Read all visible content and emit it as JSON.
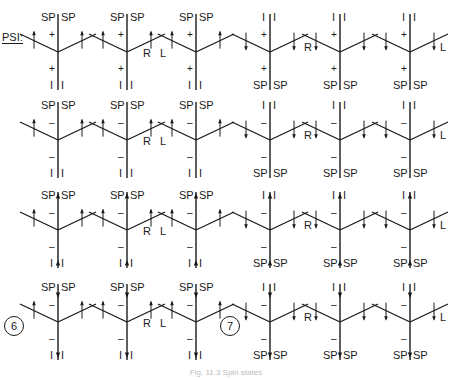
{
  "figure": {
    "psi_label": "PSI:",
    "caption": "Fig. 11.3 Spin states",
    "ink_color": "#1a1a1a",
    "rows": [
      {
        "sign": "+",
        "stem_arrow": "none",
        "cells": [
          {
            "top": [
              "SP",
              "SP"
            ],
            "bottom": [
              "I",
              "I"
            ],
            "arms": "up",
            "side": "",
            "circle": ""
          },
          {
            "top": [
              "SP",
              "SP"
            ],
            "bottom": [
              "I",
              "I"
            ],
            "arms": "up",
            "side": "R",
            "circle": ""
          },
          {
            "top": [
              "SP",
              "SP"
            ],
            "bottom": [
              "I",
              "I"
            ],
            "arms": "up",
            "side": "L",
            "circle": ""
          },
          {
            "top": [
              "I",
              "I"
            ],
            "bottom": [
              "SP",
              "SP"
            ],
            "arms": "down",
            "side": "",
            "circle": ""
          },
          {
            "top": [
              "I",
              "I"
            ],
            "bottom": [
              "SP",
              "SP"
            ],
            "arms": "down",
            "side": "R",
            "circle": ""
          },
          {
            "top": [
              "I",
              "I"
            ],
            "bottom": [
              "SP",
              "SP"
            ],
            "arms": "down",
            "side": "L",
            "circle": ""
          }
        ]
      },
      {
        "sign": "–",
        "stem_arrow": "none",
        "cells": [
          {
            "top": [
              "SP",
              "SP"
            ],
            "bottom": [
              "I",
              "I"
            ],
            "arms": "up",
            "side": "",
            "circle": ""
          },
          {
            "top": [
              "SP",
              "SP"
            ],
            "bottom": [
              "I",
              "I"
            ],
            "arms": "up",
            "side": "R",
            "circle": ""
          },
          {
            "top": [
              "SP",
              "SP"
            ],
            "bottom": [
              "I",
              "I"
            ],
            "arms": "up",
            "side": "L",
            "circle": ""
          },
          {
            "top": [
              "I",
              "I"
            ],
            "bottom": [
              "SP",
              "SP"
            ],
            "arms": "down",
            "side": "",
            "circle": ""
          },
          {
            "top": [
              "I",
              "I"
            ],
            "bottom": [
              "SP",
              "SP"
            ],
            "arms": "down",
            "side": "R",
            "circle": ""
          },
          {
            "top": [
              "I",
              "I"
            ],
            "bottom": [
              "SP",
              "SP"
            ],
            "arms": "down",
            "side": "L",
            "circle": ""
          }
        ]
      },
      {
        "sign": "–",
        "stem_arrow": "up",
        "cells": [
          {
            "top": [
              "SP",
              "SP"
            ],
            "bottom": [
              "I",
              "I"
            ],
            "arms": "up",
            "side": "",
            "circle": ""
          },
          {
            "top": [
              "SP",
              "SP"
            ],
            "bottom": [
              "I",
              "I"
            ],
            "arms": "up",
            "side": "R",
            "circle": ""
          },
          {
            "top": [
              "SP",
              "SP"
            ],
            "bottom": [
              "I",
              "I"
            ],
            "arms": "up",
            "side": "L",
            "circle": ""
          },
          {
            "top": [
              "I",
              "I"
            ],
            "bottom": [
              "SP",
              "SP"
            ],
            "arms": "down",
            "side": "",
            "circle": ""
          },
          {
            "top": [
              "I",
              "I"
            ],
            "bottom": [
              "SP",
              "SP"
            ],
            "arms": "down",
            "side": "R",
            "circle": ""
          },
          {
            "top": [
              "I",
              "I"
            ],
            "bottom": [
              "SP",
              "SP"
            ],
            "arms": "down",
            "side": "L",
            "circle": ""
          }
        ]
      },
      {
        "sign": "–",
        "stem_arrow": "down",
        "cells": [
          {
            "top": [
              "SP",
              "SP"
            ],
            "bottom": [
              "I",
              "I"
            ],
            "arms": "up",
            "side": "",
            "circle": "6"
          },
          {
            "top": [
              "SP",
              "SP"
            ],
            "bottom": [
              "I",
              "I"
            ],
            "arms": "up",
            "side": "R",
            "circle": ""
          },
          {
            "top": [
              "SP",
              "SP"
            ],
            "bottom": [
              "I",
              "I"
            ],
            "arms": "up",
            "side": "L",
            "circle": ""
          },
          {
            "top": [
              "I",
              "I"
            ],
            "bottom": [
              "SP",
              "SP"
            ],
            "arms": "down",
            "side": "",
            "circle": "7"
          },
          {
            "top": [
              "I",
              "I"
            ],
            "bottom": [
              "SP",
              "SP"
            ],
            "arms": "down",
            "side": "R",
            "circle": ""
          },
          {
            "top": [
              "I",
              "I"
            ],
            "bottom": [
              "SP",
              "SP"
            ],
            "arms": "down",
            "side": "L",
            "circle": ""
          }
        ]
      }
    ]
  }
}
